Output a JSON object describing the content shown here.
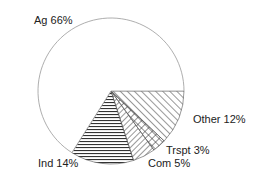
{
  "chart_data": {
    "type": "pie",
    "title": "",
    "start_angle_deg": 0,
    "direction": "clockwise",
    "categories": [
      "Other",
      "Trspt",
      "Com",
      "Ind",
      "Ag"
    ],
    "values": [
      12,
      3,
      5,
      14,
      66
    ],
    "labels": [
      "Other 12%",
      "Trspt 3%",
      "Com 5%",
      "Ind 14%",
      "Ag 66%"
    ],
    "patterns": [
      "diagonal-hatch",
      "cross-hatch",
      "back-diagonal-hatch",
      "horizontal-lines",
      "none"
    ],
    "legend": "none"
  },
  "labels": {
    "ag": "Ag 66%",
    "other": "Other 12%",
    "trspt": "Trspt 3%",
    "com": "Com 5%",
    "ind": "Ind 14%"
  }
}
